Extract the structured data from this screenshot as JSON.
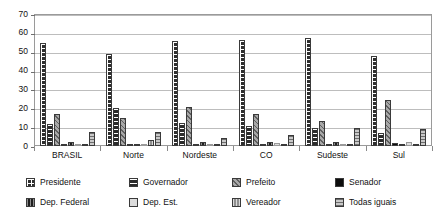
{
  "chart_data": {
    "type": "bar",
    "title": "",
    "subtitle": "",
    "xlabel": "",
    "ylabel": "",
    "ylim": [
      0,
      70
    ],
    "ytick_step": 10,
    "yticks": [
      70,
      60,
      50,
      40,
      30,
      20,
      10,
      0
    ],
    "grid": true,
    "legend_position": "bottom",
    "categories": [
      "BRASIL",
      "Norte",
      "Nordeste",
      "CO",
      "Sudeste",
      "Sul"
    ],
    "series": [
      {
        "name": "Presidente",
        "pattern": "checker-dark",
        "color": "#2f2f2f",
        "values": [
          54.5,
          49.0,
          55.5,
          56.0,
          57.5,
          48.0
        ]
      },
      {
        "name": "Governador",
        "pattern": "horizontal-dark",
        "color": "#2b2b2b",
        "values": [
          11.5,
          20.0,
          12.0,
          10.5,
          9.5,
          7.0
        ]
      },
      {
        "name": "Prefeito",
        "pattern": "diagonal-hatch",
        "color": "#a8a8a8",
        "values": [
          17.0,
          15.0,
          20.5,
          17.0,
          13.5,
          24.5
        ]
      },
      {
        "name": "Senador",
        "pattern": "solid-black",
        "color": "#0d0d0d",
        "values": [
          0.7,
          0.6,
          0.4,
          1.0,
          0.7,
          1.5
        ]
      },
      {
        "name": "Dep. Federal",
        "pattern": "vertical-dark",
        "color": "#1f1f1f",
        "values": [
          2.0,
          1.2,
          2.0,
          2.2,
          2.0,
          1.3
        ]
      },
      {
        "name": "Dep. Est.",
        "pattern": "solid-light",
        "color": "#dcdcdc",
        "values": [
          0.5,
          0.3,
          0.5,
          1.8,
          0.6,
          2.0
        ]
      },
      {
        "name": "Vereador",
        "pattern": "vertical-gray",
        "color": "#8f8f8f",
        "values": [
          1.0,
          3.0,
          1.0,
          0.8,
          0.9,
          0.9
        ]
      },
      {
        "name": "Todas iguais",
        "pattern": "horizontal-gray",
        "color": "#c9c9c9",
        "values": [
          7.5,
          7.5,
          4.0,
          6.0,
          9.5,
          9.0
        ]
      }
    ]
  },
  "legend": {
    "rows": [
      [
        {
          "label": "Presidente",
          "swatch": "presidente-swatch-icon"
        },
        {
          "label": "Governador",
          "swatch": "governador-swatch-icon"
        },
        {
          "label": "Prefeito",
          "swatch": "prefeito-swatch-icon"
        },
        {
          "label": "Senador",
          "swatch": "senador-swatch-icon"
        }
      ],
      [
        {
          "label": "Dep. Federal",
          "swatch": "dep-federal-swatch-icon"
        },
        {
          "label": "Dep. Est.",
          "swatch": "dep-est-swatch-icon"
        },
        {
          "label": "Vereador",
          "swatch": "vereador-swatch-icon"
        },
        {
          "label": "Todas iguais",
          "swatch": "todas-iguais-swatch-icon"
        }
      ]
    ]
  }
}
